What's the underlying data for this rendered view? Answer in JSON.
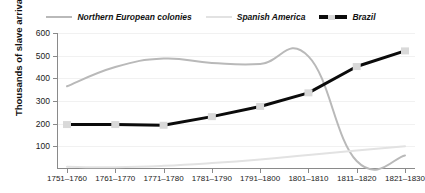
{
  "legend": {
    "items": [
      {
        "label": "Northern European colonies",
        "key": "northern_european",
        "color": "#b9b9b9",
        "style": "solid"
      },
      {
        "label": "Spanish America",
        "key": "spanish_america",
        "color": "#e2e2e2",
        "style": "solid"
      },
      {
        "label": "Brazil",
        "key": "brazil",
        "color": "#0b0b0b",
        "style": "dashed-marker"
      }
    ]
  },
  "axes": {
    "y_title": "Thousands of slave arrivals",
    "y_ticks": [
      600,
      500,
      400,
      300,
      200,
      100
    ],
    "x_ticks": [
      "1751–1760",
      "1761–1770",
      "1771–1780",
      "1781–1790",
      "1791–1800",
      "1801–1810",
      "1811–1820",
      "1821–1830"
    ]
  },
  "chart_data": {
    "type": "line",
    "title": "",
    "xlabel": "",
    "ylabel": "Thousands of slave arrivals",
    "ylim": [
      0,
      600
    ],
    "ytick_step": 100,
    "grid": true,
    "legend_position": "top",
    "categories": [
      "1751–1760",
      "1761–1770",
      "1771–1780",
      "1781–1790",
      "1791–1800",
      "1801–1810",
      "1811–1820",
      "1821–1830"
    ],
    "series": [
      {
        "name": "Northern European colonies",
        "color": "#b9b9b9",
        "line_width": 2,
        "smooth": true,
        "markers": false,
        "values": [
          365,
          450,
          487,
          468,
          463,
          497,
          35,
          60
        ]
      },
      {
        "name": "Spanish America",
        "color": "#e2e2e2",
        "line_width": 2,
        "smooth": true,
        "markers": false,
        "values": [
          10,
          8,
          14,
          26,
          42,
          62,
          82,
          100
        ]
      },
      {
        "name": "Brazil",
        "color": "#0b0b0b",
        "line_width": 3,
        "smooth": false,
        "markers": true,
        "marker_color": "#d9d9d9",
        "values": [
          196,
          196,
          193,
          231,
          276,
          336,
          452,
          521
        ]
      }
    ]
  }
}
